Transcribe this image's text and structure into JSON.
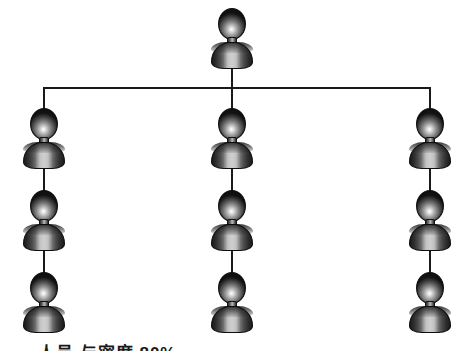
{
  "diagram": {
    "type": "organization-tree",
    "title": "",
    "background_color": "#ffffff",
    "line_color": "#1a1a1a",
    "figure": {
      "icon": "person-icon",
      "head_color_center": "#ffffff",
      "head_color_edge": "#111111",
      "body_color_center": "#cfcfcf",
      "body_color_edge": "#1b1b1b"
    },
    "root": {
      "id": "root",
      "label": "",
      "x": 232,
      "y": 8
    },
    "columns": [
      {
        "id": "column-left",
        "x": 45,
        "nodes": [
          {
            "id": "node-left-1",
            "label": "",
            "y": 108
          },
          {
            "id": "node-left-2",
            "label": "",
            "y": 190
          },
          {
            "id": "node-left-3",
            "label": "",
            "y": 272
          }
        ]
      },
      {
        "id": "column-center",
        "x": 232,
        "nodes": [
          {
            "id": "node-center-1",
            "label": "",
            "y": 108
          },
          {
            "id": "node-center-2",
            "label": "",
            "y": 190
          },
          {
            "id": "node-center-3",
            "label": "",
            "y": 272
          }
        ]
      },
      {
        "id": "column-right",
        "x": 429,
        "nodes": [
          {
            "id": "node-right-1",
            "label": "",
            "y": 108
          },
          {
            "id": "node-right-2",
            "label": "",
            "y": 190
          },
          {
            "id": "node-right-3",
            "label": "",
            "y": 272
          }
        ]
      }
    ]
  },
  "caption": {
    "clipped": true,
    "note": "text clipped at bottom edge of image",
    "text": "人员 与密度 80%"
  }
}
